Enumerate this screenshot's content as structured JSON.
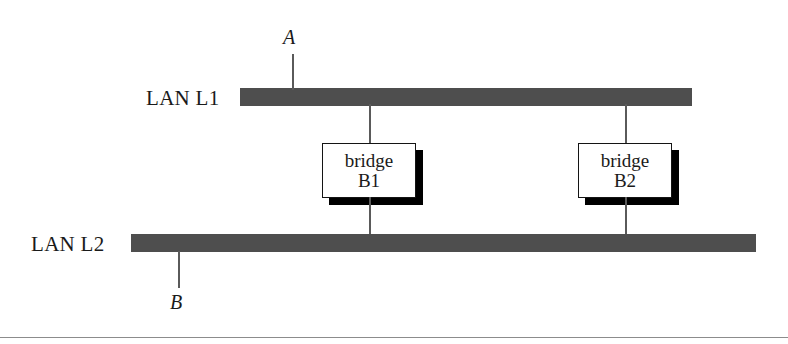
{
  "figure": {
    "type": "network-topology-diagram",
    "background_color": "#ffffff",
    "bar_color": "#4e4e4e",
    "line_color": "#5a5a5a",
    "box_border_color": "#141414",
    "shadow_color": "#000000",
    "rule_color": "#8c8c8c"
  },
  "lans": [
    {
      "id": "l1",
      "label": "LAN L1"
    },
    {
      "id": "l2",
      "label": "LAN L2"
    }
  ],
  "stations": [
    {
      "id": "a",
      "label": "A",
      "attached_to": "LAN L1"
    },
    {
      "id": "b",
      "label": "B",
      "attached_to": "LAN L2"
    }
  ],
  "bridges": [
    {
      "id": "b1",
      "line1": "bridge",
      "line2": "B1"
    },
    {
      "id": "b2",
      "line1": "bridge",
      "line2": "B2"
    }
  ]
}
